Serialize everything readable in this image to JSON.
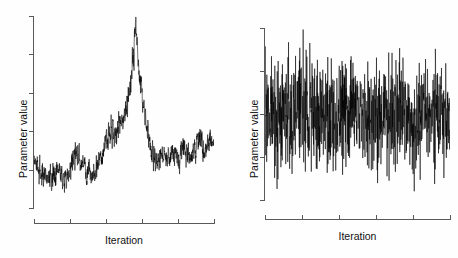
{
  "figure": {
    "background": "#fefefe",
    "foreground": "#000000",
    "axis_color": "#595959",
    "width": 458,
    "height": 258
  },
  "panels": [
    {
      "id": "left",
      "name": "poorly-mixing-trace",
      "ylabel": "Parameter value",
      "xlabel": "Iteration",
      "ytick_count": 6,
      "xtick_count": 6,
      "ytick_labels": [],
      "xtick_labels": []
    },
    {
      "id": "right",
      "name": "well-mixing-trace",
      "ylabel": "Parameter value",
      "xlabel": "Iteration",
      "ytick_count": 5,
      "xtick_count": 6,
      "ytick_labels": [],
      "xtick_labels": []
    }
  ],
  "chart_data": [
    {
      "type": "line",
      "title": "",
      "subtitle": "",
      "xlabel": "Iteration",
      "ylabel": "Parameter value",
      "grid": false,
      "legend": null,
      "xlim": [
        0,
        1000
      ],
      "ylim": [
        0,
        1
      ],
      "axis_ticks_labeled": false,
      "description": "MCMC trace plot showing poor mixing: slow wandering baseline with a large transient excursion near iteration 560",
      "series": [
        {
          "name": "chain",
          "comment": "baseline envelope: level values are the slowly varying mean in y-units (0=bottom of axis, 1=top); noise is the local half-amplitude of the fast jitter",
          "baseline_x": [
            0,
            20,
            45,
            70,
            95,
            120,
            150,
            175,
            200,
            230,
            260,
            290,
            320,
            345,
            370,
            400,
            425,
            450,
            475,
            500,
            520,
            540,
            555,
            565,
            575,
            590,
            605,
            625,
            650,
            680,
            710,
            740,
            770,
            800,
            830,
            860,
            890,
            920,
            950,
            975,
            1000
          ],
          "baseline_y": [
            0.255,
            0.215,
            0.175,
            0.15,
            0.165,
            0.2,
            0.17,
            0.155,
            0.21,
            0.3,
            0.245,
            0.19,
            0.175,
            0.205,
            0.27,
            0.355,
            0.42,
            0.4,
            0.45,
            0.48,
            0.56,
            0.68,
            0.81,
            0.935,
            0.83,
            0.7,
            0.56,
            0.43,
            0.3,
            0.25,
            0.275,
            0.245,
            0.3,
            0.27,
            0.325,
            0.255,
            0.295,
            0.36,
            0.305,
            0.345,
            0.32
          ],
          "noise": [
            0.035,
            0.04,
            0.045,
            0.042,
            0.038,
            0.044,
            0.04,
            0.036,
            0.042,
            0.046,
            0.04,
            0.038,
            0.036,
            0.04,
            0.044,
            0.048,
            0.05,
            0.046,
            0.048,
            0.046,
            0.05,
            0.054,
            0.06,
            0.062,
            0.058,
            0.054,
            0.05,
            0.046,
            0.042,
            0.038,
            0.04,
            0.038,
            0.042,
            0.04,
            0.044,
            0.038,
            0.042,
            0.046,
            0.04,
            0.044,
            0.04
          ],
          "n_points": 1000
        }
      ]
    },
    {
      "type": "line",
      "title": "",
      "subtitle": "",
      "xlabel": "Iteration",
      "ylabel": "Parameter value",
      "grid": false,
      "legend": null,
      "xlim": [
        0,
        1000
      ],
      "ylim": [
        0,
        1
      ],
      "axis_ticks_labeled": false,
      "description": "MCMC trace plot showing good mixing: stationary white-noise-like fluctuation about a constant mean",
      "series": [
        {
          "name": "chain",
          "comment": "stationary chain: constant mean with constant noise half-amplitude in y-units",
          "mean": 0.5,
          "noise": 0.22,
          "n_points": 1000
        }
      ]
    }
  ]
}
